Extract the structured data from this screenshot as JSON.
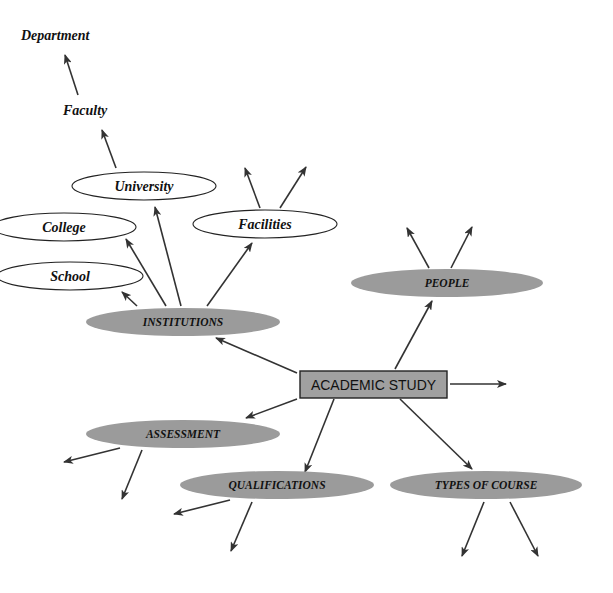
{
  "diagram": {
    "colors": {
      "background": "#ffffff",
      "shaded_node": "#9b9b9b",
      "central_box": "#a0a0a0",
      "outline": "#222222",
      "arrow": "#333333"
    },
    "central": {
      "label": "ACADEMIC STUDY"
    },
    "main_nodes": {
      "institutions": "INSTITUTIONS",
      "people": "PEOPLE",
      "assessment": "ASSESSMENT",
      "qualifications": "QUALIFICATIONS",
      "types_of_course": "TYPES OF COURSE"
    },
    "sub_nodes": {
      "university": "University",
      "college": "College",
      "school": "School",
      "facilities": "Facilities"
    },
    "text_nodes": {
      "faculty": "Faculty",
      "department": "Department"
    }
  }
}
